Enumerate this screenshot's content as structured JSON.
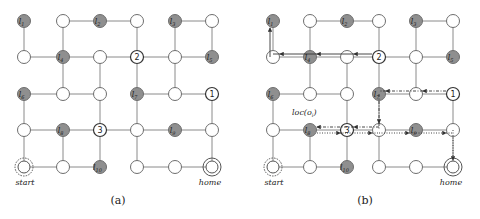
{
  "figure": {
    "panels": [
      {
        "id": "a",
        "caption": "(a)",
        "caption_pos": [
          118,
          204
        ],
        "cols": [
          24,
          63,
          100,
          137,
          175,
          212
        ],
        "rows": [
          21,
          57,
          94,
          130,
          167
        ]
      },
      {
        "id": "b",
        "caption": "(b)",
        "caption_pos": [
          365,
          204
        ],
        "cols": [
          273,
          310,
          347,
          379,
          416,
          453
        ],
        "rows": [
          21,
          57,
          94,
          130,
          167
        ]
      }
    ],
    "nodes": [
      {
        "c": 0,
        "r": 0,
        "type": "landmark",
        "label": "l",
        "sub": "1"
      },
      {
        "c": 1,
        "r": 0,
        "type": "empty"
      },
      {
        "c": 2,
        "r": 0,
        "type": "landmark",
        "label": "l",
        "sub": "2"
      },
      {
        "c": 3,
        "r": 0,
        "type": "empty"
      },
      {
        "c": 4,
        "r": 0,
        "type": "landmark",
        "label": "l",
        "sub": "3"
      },
      {
        "c": 5,
        "r": 0,
        "type": "empty"
      },
      {
        "c": 0,
        "r": 1,
        "type": "empty"
      },
      {
        "c": 1,
        "r": 1,
        "type": "landmark",
        "label": "l",
        "sub": "4"
      },
      {
        "c": 2,
        "r": 1,
        "type": "empty"
      },
      {
        "c": 3,
        "r": 1,
        "type": "numbered",
        "label": "2"
      },
      {
        "c": 4,
        "r": 1,
        "type": "empty"
      },
      {
        "c": 5,
        "r": 1,
        "type": "landmark",
        "label": "l",
        "sub": "5"
      },
      {
        "c": 0,
        "r": 2,
        "type": "landmark",
        "label": "l",
        "sub": "6"
      },
      {
        "c": 1,
        "r": 2,
        "type": "empty"
      },
      {
        "c": 2,
        "r": 2,
        "type": "empty"
      },
      {
        "c": 3,
        "r": 2,
        "type": "landmark",
        "label": "l",
        "sub": "7"
      },
      {
        "c": 4,
        "r": 2,
        "type": "empty"
      },
      {
        "c": 5,
        "r": 2,
        "type": "numbered",
        "label": "1"
      },
      {
        "c": 0,
        "r": 3,
        "type": "empty"
      },
      {
        "c": 1,
        "r": 3,
        "type": "landmark",
        "label": "l",
        "sub": "8"
      },
      {
        "c": 2,
        "r": 3,
        "type": "numbered",
        "label": "3"
      },
      {
        "c": 3,
        "r": 3,
        "type": "empty"
      },
      {
        "c": 4,
        "r": 3,
        "type": "landmark",
        "label": "l",
        "sub": "9"
      },
      {
        "c": 5,
        "r": 3,
        "type": "empty"
      },
      {
        "c": 0,
        "r": 4,
        "type": "start",
        "label": "start"
      },
      {
        "c": 1,
        "r": 4,
        "type": "empty"
      },
      {
        "c": 2,
        "r": 4,
        "type": "landmark",
        "label": "l",
        "sub": "10"
      },
      {
        "c": 3,
        "r": 4,
        "type": "empty"
      },
      {
        "c": 4,
        "r": 4,
        "type": "empty"
      },
      {
        "c": 5,
        "r": 4,
        "type": "home",
        "label": "home"
      }
    ],
    "edges": [
      [
        [
          1,
          0
        ],
        [
          2,
          0
        ]
      ],
      [
        [
          2,
          0
        ],
        [
          3,
          0
        ]
      ],
      [
        [
          4,
          0
        ],
        [
          5,
          0
        ]
      ],
      [
        [
          0,
          0
        ],
        [
          0,
          1
        ]
      ],
      [
        [
          1,
          0
        ],
        [
          1,
          1
        ]
      ],
      [
        [
          3,
          0
        ],
        [
          3,
          1
        ]
      ],
      [
        [
          4,
          0
        ],
        [
          4,
          1
        ]
      ],
      [
        [
          5,
          0
        ],
        [
          5,
          1
        ]
      ],
      [
        [
          0,
          1
        ],
        [
          1,
          1
        ]
      ],
      [
        [
          1,
          1
        ],
        [
          2,
          1
        ]
      ],
      [
        [
          2,
          1
        ],
        [
          3,
          1
        ]
      ],
      [
        [
          3,
          1
        ],
        [
          4,
          1
        ]
      ],
      [
        [
          4,
          1
        ],
        [
          5,
          1
        ]
      ],
      [
        [
          1,
          1
        ],
        [
          1,
          2
        ]
      ],
      [
        [
          2,
          1
        ],
        [
          2,
          2
        ]
      ],
      [
        [
          3,
          1
        ],
        [
          3,
          2
        ]
      ],
      [
        [
          4,
          1
        ],
        [
          4,
          2
        ]
      ],
      [
        [
          0,
          2
        ],
        [
          1,
          2
        ]
      ],
      [
        [
          1,
          2
        ],
        [
          2,
          2
        ]
      ],
      [
        [
          3,
          2
        ],
        [
          4,
          2
        ]
      ],
      [
        [
          4,
          2
        ],
        [
          5,
          2
        ]
      ],
      [
        [
          0,
          2
        ],
        [
          0,
          3
        ]
      ],
      [
        [
          2,
          2
        ],
        [
          2,
          3
        ]
      ],
      [
        [
          3,
          2
        ],
        [
          3,
          3
        ]
      ],
      [
        [
          5,
          2
        ],
        [
          5,
          3
        ]
      ],
      [
        [
          0,
          3
        ],
        [
          1,
          3
        ]
      ],
      [
        [
          1,
          3
        ],
        [
          2,
          3
        ]
      ],
      [
        [
          2,
          3
        ],
        [
          3,
          3
        ]
      ],
      [
        [
          3,
          3
        ],
        [
          4,
          3
        ]
      ],
      [
        [
          4,
          3
        ],
        [
          5,
          3
        ]
      ],
      [
        [
          0,
          3
        ],
        [
          0,
          4
        ]
      ],
      [
        [
          1,
          3
        ],
        [
          1,
          4
        ]
      ],
      [
        [
          2,
          3
        ],
        [
          2,
          4
        ]
      ],
      [
        [
          3,
          3
        ],
        [
          3,
          4
        ]
      ],
      [
        [
          5,
          3
        ],
        [
          5,
          4
        ]
      ],
      [
        [
          0,
          4
        ],
        [
          1,
          4
        ]
      ],
      [
        [
          1,
          4
        ],
        [
          2,
          4
        ]
      ],
      [
        [
          3,
          4
        ],
        [
          4,
          4
        ]
      ],
      [
        [
          4,
          4
        ],
        [
          5,
          4
        ]
      ]
    ],
    "annotation": {
      "text": "loc(o",
      "sub": "i",
      "close": ")",
      "panel": "b",
      "pos": [
        292,
        115
      ]
    },
    "paths_b": [
      {
        "style": "solid",
        "offset": [
          -3,
          -3
        ],
        "points": [
          [
            3,
            1
          ],
          [
            2,
            1
          ],
          [
            1,
            1
          ],
          [
            0,
            1
          ],
          [
            0,
            0
          ]
        ]
      },
      {
        "style": "dashdot",
        "offset": [
          0,
          -3
        ],
        "points": [
          [
            5,
            2
          ],
          [
            4,
            2
          ],
          [
            3,
            2
          ],
          [
            3,
            3
          ],
          [
            2,
            3
          ],
          [
            1,
            3
          ]
        ]
      },
      {
        "style": "dotted",
        "offset": [
          0,
          3
        ],
        "points": [
          [
            1,
            3
          ],
          [
            2,
            3
          ],
          [
            3,
            3
          ],
          [
            4,
            3
          ],
          [
            5,
            3
          ],
          [
            5,
            4
          ]
        ]
      }
    ]
  }
}
